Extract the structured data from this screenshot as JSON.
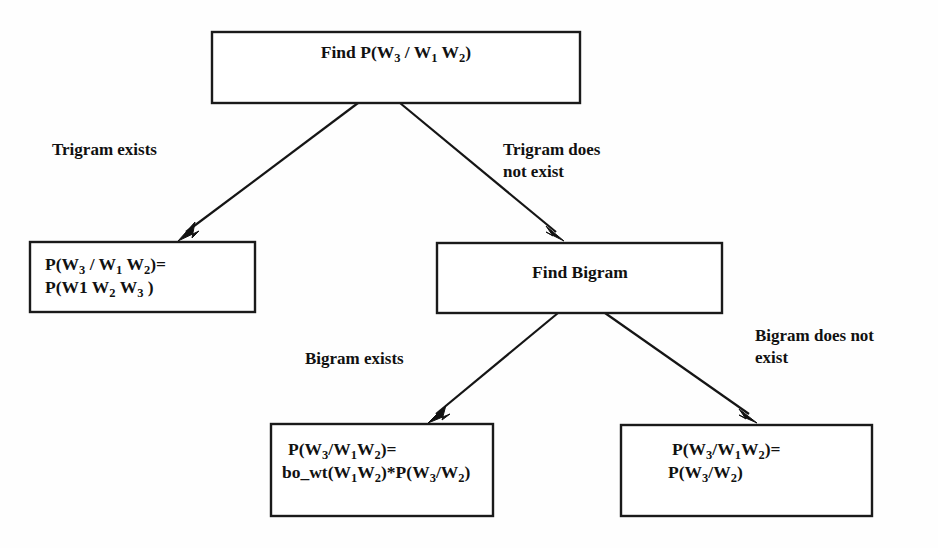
{
  "diagram": {
    "type": "flowchart",
    "background_color": "#fefefe",
    "line_color": "#151515",
    "box_fill": "#ffffff",
    "nodes": [
      {
        "id": "root",
        "name": "find-trigram-probability",
        "align": "center",
        "lines": [
          {
            "parts": [
              {
                "t": "Find P(W",
                "sub": false
              },
              {
                "t": "3",
                "sub": true
              },
              {
                "t": " / W",
                "sub": false
              },
              {
                "t": "1",
                "sub": true
              },
              {
                "t": " W",
                "sub": false
              },
              {
                "t": "2",
                "sub": true
              },
              {
                "t": ")",
                "sub": false
              }
            ]
          }
        ],
        "plain": "Find P(W3 / W1 W2)"
      },
      {
        "id": "trigram_result",
        "name": "trigram-probability-result",
        "align": "left",
        "lines": [
          {
            "parts": [
              {
                "t": "P(W",
                "sub": false
              },
              {
                "t": "3",
                "sub": true
              },
              {
                "t": " / W",
                "sub": false
              },
              {
                "t": "1",
                "sub": true
              },
              {
                "t": " W",
                "sub": false
              },
              {
                "t": "2",
                "sub": true
              },
              {
                "t": ")=",
                "sub": false
              }
            ]
          },
          {
            "parts": [
              {
                "t": "P(W1 W",
                "sub": false
              },
              {
                "t": "2",
                "sub": true
              },
              {
                "t": " W",
                "sub": false
              },
              {
                "t": "3",
                "sub": true
              },
              {
                "t": " )",
                "sub": false
              }
            ]
          }
        ],
        "plain": "P(W3 / W1 W2)= P(W1 W2 W3 )"
      },
      {
        "id": "find_bigram",
        "name": "find-bigram",
        "align": "center",
        "lines": [
          {
            "parts": [
              {
                "t": "Find Bigram",
                "sub": false
              }
            ]
          }
        ],
        "plain": "Find Bigram"
      },
      {
        "id": "bigram_backoff",
        "name": "bigram-backoff-result",
        "align": "left",
        "lines": [
          {
            "parts": [
              {
                "t": "P(W",
                "sub": false
              },
              {
                "t": "3",
                "sub": true
              },
              {
                "t": "/W",
                "sub": false
              },
              {
                "t": "1",
                "sub": true
              },
              {
                "t": "W",
                "sub": false
              },
              {
                "t": "2",
                "sub": true
              },
              {
                "t": ")=",
                "sub": false
              }
            ]
          },
          {
            "parts": [
              {
                "t": "bo_wt(W",
                "sub": false
              },
              {
                "t": "1",
                "sub": true
              },
              {
                "t": "W",
                "sub": false
              },
              {
                "t": "2",
                "sub": true
              },
              {
                "t": ")*P(W",
                "sub": false
              },
              {
                "t": "3",
                "sub": true
              },
              {
                "t": "/W",
                "sub": false
              },
              {
                "t": "2",
                "sub": true
              },
              {
                "t": ")",
                "sub": false
              }
            ]
          }
        ],
        "plain": "P(W3/W1W2)= bo_wt(W1W2)*P(W3/W2)"
      },
      {
        "id": "unigram_backoff",
        "name": "bigram-probability-result",
        "align": "left",
        "lines": [
          {
            "parts": [
              {
                "t": "P(W",
                "sub": false
              },
              {
                "t": "3",
                "sub": true
              },
              {
                "t": "/W",
                "sub": false
              },
              {
                "t": "1",
                "sub": true
              },
              {
                "t": "W",
                "sub": false
              },
              {
                "t": "2",
                "sub": true
              },
              {
                "t": ")=",
                "sub": false
              }
            ]
          },
          {
            "parts": [
              {
                "t": "P(W",
                "sub": false
              },
              {
                "t": "3",
                "sub": true
              },
              {
                "t": "/W",
                "sub": false
              },
              {
                "t": "2",
                "sub": true
              },
              {
                "t": ")",
                "sub": false
              }
            ]
          }
        ],
        "plain": "P(W3/W1W2)= P(W3/W2)"
      }
    ],
    "edge_labels": [
      {
        "id": "trigram_exists",
        "name": "edge-label-trigram-exists",
        "lines": [
          "Trigram exists"
        ]
      },
      {
        "id": "trigram_missing",
        "name": "edge-label-trigram-not-exist",
        "lines": [
          "Trigram does",
          "not exist"
        ]
      },
      {
        "id": "bigram_exists",
        "name": "edge-label-bigram-exists",
        "lines": [
          "Bigram exists"
        ]
      },
      {
        "id": "bigram_missing",
        "name": "edge-label-bigram-not-exist",
        "lines": [
          "Bigram  does  not",
          "exist"
        ]
      }
    ]
  }
}
